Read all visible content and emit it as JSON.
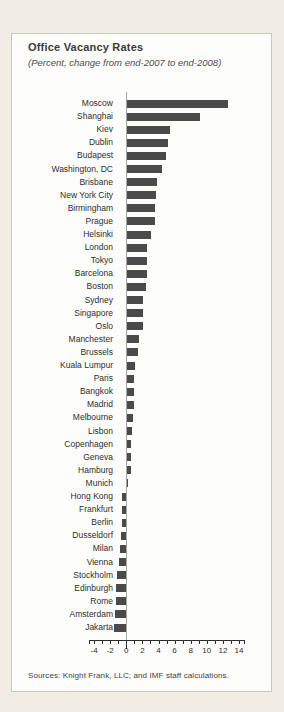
{
  "panel": {
    "title": "Office Vacancy Rates",
    "subtitle": "(Percent, change from end-2007 to end-2008)",
    "source": "Sources: Knight Frank, LLC; and IMF staff calculations."
  },
  "colors": {
    "page_bg": "#f0ede4",
    "card_bg": "#fdfdfb",
    "card_border": "#c9c8c0",
    "bar": "#4a4a4a",
    "axis": "#2e2e2e",
    "zero_line": "#a9a8a0"
  },
  "chart_data": {
    "type": "bar",
    "orientation": "horizontal",
    "title": "Office Vacancy Rates",
    "subtitle": "(Percent, change from end-2007 to end-2008)",
    "xlabel": "",
    "ylabel": "",
    "xlim": [
      -4,
      14
    ],
    "xticks": [
      -4,
      -2,
      0,
      2,
      4,
      6,
      8,
      10,
      12,
      14
    ],
    "minor_tick_step": 1,
    "grid": false,
    "legend": "none",
    "categories": [
      "Moscow",
      "Shanghai",
      "Kiev",
      "Dublin",
      "Budapest",
      "Washington, DC",
      "Brisbane",
      "New York City",
      "Birmingham",
      "Prague",
      "Helsinki",
      "London",
      "Tokyo",
      "Barcelona",
      "Boston",
      "Sydney",
      "Singapore",
      "Oslo",
      "Manchester",
      "Brussels",
      "Kuala Lumpur",
      "Paris",
      "Bangkok",
      "Madrid",
      "Melbourne",
      "Lisbon",
      "Copenhagen",
      "Geneva",
      "Hamburg",
      "Munich",
      "Hong Kong",
      "Frankfurt",
      "Berlin",
      "Dusseldorf",
      "Milan",
      "Vienna",
      "Stockholm",
      "Edinburgh",
      "Rome",
      "Amsterdam",
      "Jakarta"
    ],
    "values": [
      12.5,
      9.0,
      5.3,
      5.1,
      4.8,
      4.3,
      3.7,
      3.6,
      3.4,
      3.4,
      3.0,
      2.5,
      2.4,
      2.4,
      2.3,
      2.0,
      2.0,
      2.0,
      1.5,
      1.3,
      1.0,
      0.8,
      0.8,
      0.8,
      0.7,
      0.6,
      0.5,
      0.5,
      0.4,
      0.1,
      -0.5,
      -0.5,
      -0.5,
      -0.6,
      -0.8,
      -0.9,
      -1.1,
      -1.3,
      -1.3,
      -1.4,
      -1.5
    ]
  }
}
